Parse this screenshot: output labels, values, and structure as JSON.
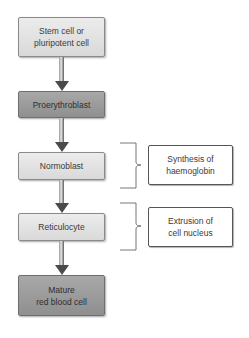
{
  "diagram": {
    "type": "flowchart",
    "steps": [
      {
        "label_line1": "Stem cell or",
        "label_line2": "pluripotent cell",
        "shade": "light"
      },
      {
        "label_line1": "Proerythroblast",
        "label_line2": "",
        "shade": "dark"
      },
      {
        "label_line1": "Normoblast",
        "label_line2": "",
        "shade": "light"
      },
      {
        "label_line1": "Reticulocyte",
        "label_line2": "",
        "shade": "light"
      },
      {
        "label_line1": "Mature",
        "label_line2": "red blood cell",
        "shade": "dark"
      }
    ],
    "annotations": [
      {
        "label_line1": "Synthesis of",
        "label_line2": "haemoglobin",
        "applies_to": "Normoblast"
      },
      {
        "label_line1": "Extrusion of",
        "label_line2": "cell nucleus",
        "applies_to": "Reticulocyte"
      }
    ],
    "colors": {
      "light_box": "#e2e2e2",
      "dark_box": "#9c9c9c",
      "arrow": "#4a4a4a",
      "annotation_border": "#555555"
    }
  }
}
